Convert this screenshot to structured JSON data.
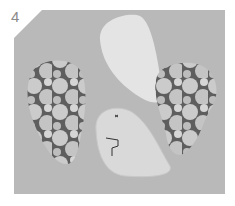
{
  "step": {
    "number": "4"
  },
  "illustration": {
    "description": "Sewing step: two floral fabric teardrop pieces and two pale paper pattern pieces on grey background",
    "colors": {
      "background": "#b9b9b9",
      "fabric_light": "#cfcfcf",
      "fabric_dark": "#5a5a5a",
      "pattern_piece": "#e4e4e4",
      "pattern_piece_lower": "#d9d9d9",
      "marking": "#333333"
    }
  }
}
